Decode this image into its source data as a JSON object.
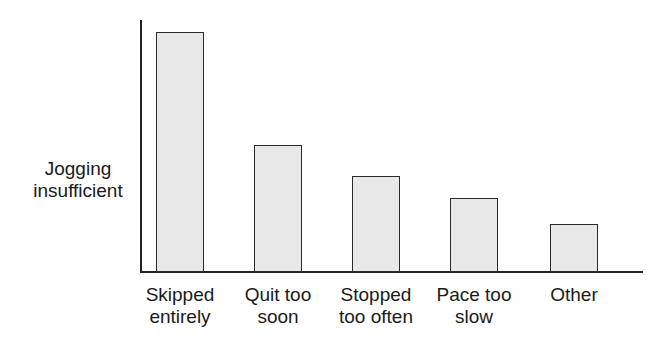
{
  "chart_data": {
    "type": "bar",
    "title": "",
    "xlabel": "",
    "ylabel": "Jogging insufficient",
    "categories": [
      "Skipped entirely",
      "Quit too soon",
      "Stopped too often",
      "Pace too slow",
      "Other"
    ],
    "values": [
      100,
      53,
      40,
      31,
      20
    ],
    "value_scale": "relative (no numeric axis ticks shown)",
    "grid": false,
    "legend": null
  },
  "labels": {
    "ylabel_line1": "Jogging",
    "ylabel_line2": "insufficient",
    "x": [
      {
        "l1": "Skipped",
        "l2": "entirely"
      },
      {
        "l1": "Quit too",
        "l2": "soon"
      },
      {
        "l1": "Stopped",
        "l2": "too often"
      },
      {
        "l1": "Pace too",
        "l2": "slow"
      },
      {
        "l1": "Other",
        "l2": ""
      }
    ]
  },
  "colors": {
    "bar_fill": "#e8e8e8",
    "bar_stroke": "#2a2a2a",
    "axis": "#222222"
  }
}
